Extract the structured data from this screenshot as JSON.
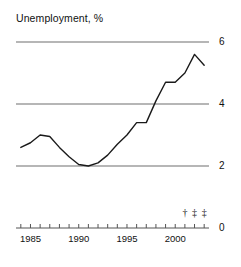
{
  "chart": {
    "title": "Unemployment, %"
  },
  "axes": {
    "y_tick_labels": [
      "6",
      "4",
      "2",
      "0"
    ],
    "x_tick_labels": [
      "1985",
      "1990",
      "1995",
      "2000"
    ]
  },
  "footnotes": {
    "marks": [
      "†",
      "‡",
      "‡"
    ]
  },
  "chart_data": {
    "type": "line",
    "title": "Unemployment, %",
    "xlabel": "",
    "ylabel": "Unemployment, %",
    "xlim": [
      1983.5,
      2003.5
    ],
    "ylim": [
      0,
      6
    ],
    "grid": true,
    "grid_values": [
      2,
      4,
      6
    ],
    "legend": "none",
    "x": [
      1984,
      1985,
      1986,
      1987,
      1988,
      1989,
      1990,
      1991,
      1992,
      1993,
      1994,
      1995,
      1996,
      1997,
      1998,
      1999,
      2000,
      2001,
      2002,
      2003
    ],
    "series": [
      {
        "name": "Unemployment",
        "values": [
          2.6,
          2.75,
          3.0,
          2.95,
          2.6,
          2.3,
          2.05,
          2.0,
          2.1,
          2.35,
          2.7,
          3.0,
          3.4,
          3.4,
          4.1,
          4.7,
          4.7,
          5.0,
          5.6,
          5.25
        ]
      }
    ],
    "x_ticks": [
      1984,
      1985,
      1986,
      1987,
      1988,
      1989,
      1990,
      1991,
      1992,
      1993,
      1994,
      1995,
      1996,
      1997,
      1998,
      1999,
      2000,
      2001,
      2002,
      2003
    ],
    "x_tick_labels_shown": {
      "1985": "1985",
      "1990": "1990",
      "1995": "1995",
      "2000": "2000"
    },
    "y_ticks": [
      0,
      2,
      4,
      6
    ],
    "annotations": [
      {
        "text": "†",
        "x": 2001
      },
      {
        "text": "‡",
        "x": 2002
      },
      {
        "text": "‡",
        "x": 2003
      }
    ]
  },
  "colors": {
    "line": "#1a1a1a",
    "grid": "#6e6e6e",
    "axis": "#555555",
    "text": "#111111",
    "background": "#ffffff"
  }
}
